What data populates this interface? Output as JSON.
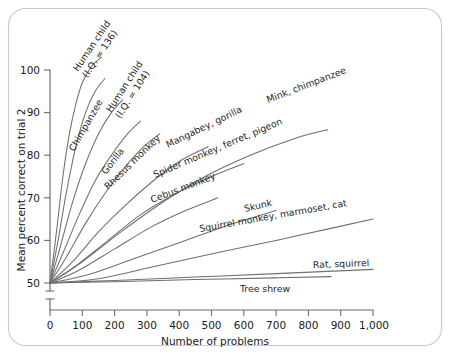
{
  "chart_data": {
    "type": "line",
    "title": "",
    "xlabel": "Number of problems",
    "ylabel": "Mean percent correct on trial 2",
    "xlim": [
      0,
      1000
    ],
    "ylim": [
      50,
      100
    ],
    "grid": false,
    "legend_position": "inline-curve-labels",
    "axis_break_y": true,
    "x_ticks": [
      {
        "value": 0,
        "label": "0"
      },
      {
        "value": 100,
        "label": "100"
      },
      {
        "value": 200,
        "label": "200"
      },
      {
        "value": 300,
        "label": "300"
      },
      {
        "value": 400,
        "label": "400"
      },
      {
        "value": 500,
        "label": "500"
      },
      {
        "value": 600,
        "label": "600"
      },
      {
        "value": 700,
        "label": "700"
      },
      {
        "value": 800,
        "label": "800"
      },
      {
        "value": 900,
        "label": "900"
      },
      {
        "value": 1000,
        "label": "1,000"
      }
    ],
    "y_ticks": [
      {
        "value": 50,
        "label": "50"
      },
      {
        "value": 60,
        "label": "60"
      },
      {
        "value": 70,
        "label": "70"
      },
      {
        "value": 80,
        "label": "80"
      },
      {
        "value": 90,
        "label": "90"
      },
      {
        "value": 100,
        "label": "100"
      }
    ],
    "series": [
      {
        "name": "Human child (I.Q. = 136)",
        "label_line_1": "Human child",
        "label_line_2": "(I.Q. = 136)",
        "x": [
          0,
          20,
          40,
          60,
          80,
          100,
          130,
          160
        ],
        "y": [
          50,
          62,
          75,
          85,
          92,
          97,
          101,
          103
        ]
      },
      {
        "name": "Chimpanzee",
        "label_line_1": "Chimpanzee",
        "label_line_2": "",
        "x": [
          0,
          25,
          50,
          80,
          110,
          140,
          170
        ],
        "y": [
          50,
          60,
          71,
          82,
          90,
          95,
          98
        ]
      },
      {
        "name": "Human child (I.Q. = 104)",
        "label_line_1": "Human child",
        "label_line_2": "(I.Q. = 104)",
        "x": [
          0,
          30,
          70,
          110,
          150,
          190,
          225
        ],
        "y": [
          50,
          58,
          69,
          78,
          85,
          90,
          93
        ]
      },
      {
        "name": "Gorilla",
        "label_line_1": "Gorilla",
        "label_line_2": "",
        "x": [
          0,
          40,
          90,
          140,
          190,
          240,
          280
        ],
        "y": [
          50,
          57,
          66,
          74,
          80,
          85,
          88
        ]
      },
      {
        "name": "Rhesus monkey",
        "label_line_1": "Rhesus monkey",
        "label_line_2": "",
        "x": [
          0,
          50,
          110,
          170,
          230,
          290,
          340
        ],
        "y": [
          50,
          56,
          64,
          71,
          77,
          82,
          85
        ]
      },
      {
        "name": "Mangabey, gorilla",
        "label_line_1": "Mangabey, gorilla",
        "label_line_2": "",
        "x": [
          0,
          70,
          150,
          230,
          320,
          410,
          490
        ],
        "y": [
          50,
          55,
          62,
          68,
          74,
          79,
          82
        ]
      },
      {
        "name": "Spider monkey, ferret, pigeon",
        "label_line_1": "Spider monkey, ferret, pigeon",
        "label_line_2": "",
        "x": [
          0,
          80,
          180,
          280,
          390,
          500,
          600
        ],
        "y": [
          50,
          54,
          60,
          66,
          71,
          75,
          78
        ]
      },
      {
        "name": "Mink, chimpanzee",
        "label_line_1": "Mink, chimpanzee",
        "label_line_2": "",
        "x": [
          0,
          100,
          220,
          350,
          480,
          620,
          760,
          860
        ],
        "y": [
          50,
          55,
          62,
          69,
          75,
          80,
          84,
          86
        ]
      },
      {
        "name": "Cebus monkey",
        "label_line_1": "Cebus monkey",
        "label_line_2": "",
        "x": [
          0,
          90,
          200,
          310,
          420,
          520
        ],
        "y": [
          50,
          53,
          58,
          63,
          67,
          70
        ]
      },
      {
        "name": "Skunk",
        "label_line_1": "Skunk",
        "label_line_2": "",
        "x": [
          0,
          120,
          270,
          420,
          570,
          700
        ],
        "y": [
          50,
          52,
          56,
          60,
          64,
          67
        ]
      },
      {
        "name": "Squirrel monkey, marmoset, cat",
        "label_line_1": "Squirrel monkey, marmoset, cat",
        "label_line_2": "",
        "x": [
          0,
          150,
          330,
          510,
          700,
          880,
          1000
        ],
        "y": [
          50,
          51,
          54,
          57,
          60,
          63,
          65
        ]
      },
      {
        "name": "Rat, squirrel",
        "label_line_1": "Rat, squirrel",
        "label_line_2": "",
        "x": [
          0,
          200,
          450,
          700,
          1000
        ],
        "y": [
          50,
          50.6,
          51.4,
          52.2,
          53.2
        ]
      },
      {
        "name": "Tree shrew",
        "label_line_1": "Tree shrew",
        "label_line_2": "",
        "x": [
          0,
          200,
          450,
          700,
          870
        ],
        "y": [
          50,
          50.3,
          50.8,
          51.2,
          51.5
        ]
      }
    ]
  },
  "colors": {
    "frame_border": "#c9c9c9",
    "axis": "#6d6d6d",
    "curve": "#6f6f6f",
    "text": "#1a1a1a",
    "background": "#ffffff"
  }
}
